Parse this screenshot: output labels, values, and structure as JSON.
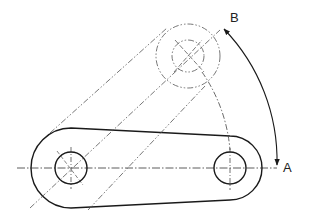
{
  "drawing": {
    "labels": {
      "a": "A",
      "b": "B"
    },
    "colors": {
      "stroke": "#1a1a1a",
      "phantom": "#555555",
      "background": "#ffffff"
    },
    "geometry": {
      "pivot_center": [
        71,
        168
      ],
      "end_hole_center_at_a": [
        230,
        168
      ],
      "end_hole_center_at_b": [
        188,
        56
      ],
      "hole_radius": 16,
      "pivot_boss_radius": 40,
      "end_boss_radius": 32,
      "point_a": [
        277,
        168
      ],
      "point_b": [
        222,
        27
      ]
    }
  }
}
